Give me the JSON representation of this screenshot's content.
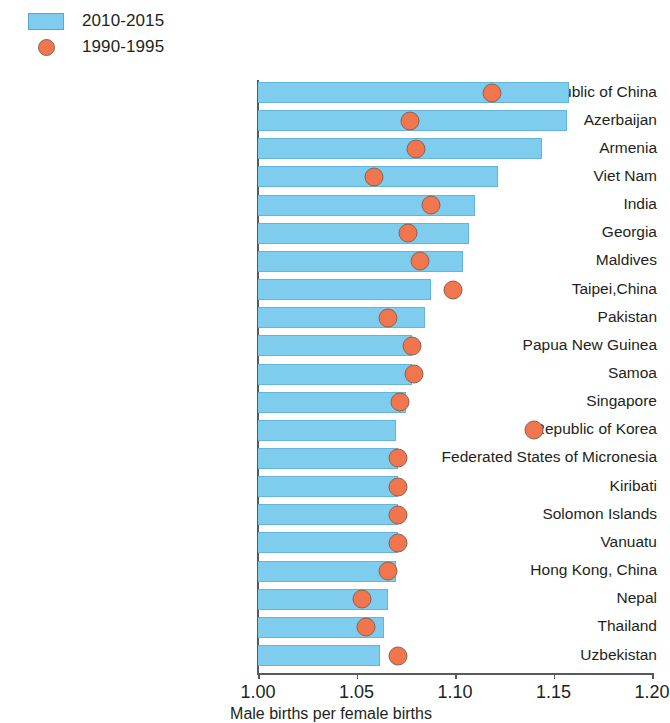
{
  "legend": {
    "items": [
      {
        "label": "2010-2015",
        "marker": "bar-swatch",
        "color": "#7fcdee"
      },
      {
        "label": "1990-1995",
        "marker": "circle-swatch",
        "color": "#f2764d"
      }
    ]
  },
  "axis": {
    "x_title": "Male births per female births",
    "ticks": [
      "1.00",
      "1.05",
      "1.10",
      "1.15",
      "1.20"
    ]
  },
  "chart_data": {
    "type": "bar",
    "title": "",
    "xlabel": "Male births per female births",
    "ylabel": "",
    "xlim": [
      1.0,
      1.2
    ],
    "xticks": [
      1.0,
      1.05,
      1.1,
      1.15,
      1.2
    ],
    "grid": false,
    "legend_position": "top-left",
    "orientation": "horizontal",
    "bar_baseline": 1.0,
    "categories": [
      "People's Republic of China",
      "Azerbaijan",
      "Armenia",
      "Viet Nam",
      "India",
      "Georgia",
      "Maldives",
      "Taipei,China",
      "Pakistan",
      "Papua New Guinea",
      "Samoa",
      "Singapore",
      "Republic of Korea",
      "Federated States of Micronesia",
      "Kiribati",
      "Solomon Islands",
      "Vanuatu",
      "Hong Kong, China",
      "Nepal",
      "Thailand",
      "Uzbekistan"
    ],
    "series": [
      {
        "name": "2010-2015",
        "type": "bar",
        "color": "#7fcdee",
        "values": [
          1.158,
          1.157,
          1.144,
          1.122,
          1.11,
          1.107,
          1.104,
          1.088,
          1.085,
          1.078,
          1.078,
          1.075,
          1.07,
          1.071,
          1.071,
          1.071,
          1.071,
          1.07,
          1.066,
          1.064,
          1.062
        ]
      },
      {
        "name": "1990-1995",
        "type": "scatter",
        "color": "#f2764d",
        "values": [
          1.119,
          1.077,
          1.08,
          1.059,
          1.088,
          1.076,
          1.082,
          1.099,
          1.066,
          1.078,
          1.079,
          1.072,
          1.14,
          1.071,
          1.071,
          1.071,
          1.071,
          1.066,
          1.053,
          1.055,
          1.071
        ]
      }
    ]
  }
}
